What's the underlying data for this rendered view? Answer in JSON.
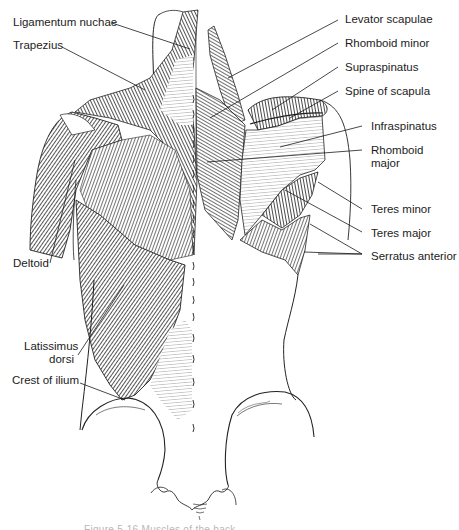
{
  "figure": {
    "labels_left": [
      {
        "id": "ligamentum-nuchae",
        "text": "Ligamentum nuchae"
      },
      {
        "id": "trapezius",
        "text": "Trapezius"
      },
      {
        "id": "deltoid",
        "text": "Deltoid"
      },
      {
        "id": "latissimus-dorsi-1",
        "text": "Latissimus"
      },
      {
        "id": "latissimus-dorsi-2",
        "text": "dorsi"
      },
      {
        "id": "crest-of-ilium",
        "text": "Crest of ilium"
      }
    ],
    "labels_right": [
      {
        "id": "levator-scapulae",
        "text": "Levator scapulae"
      },
      {
        "id": "rhomboid-minor",
        "text": "Rhomboid minor"
      },
      {
        "id": "supraspinatus",
        "text": "Supraspinatus"
      },
      {
        "id": "spine-of-scapula",
        "text": "Spine of scapula"
      },
      {
        "id": "infraspinatus",
        "text": "Infraspinatus"
      },
      {
        "id": "rhomboid-major-1",
        "text": "Rhomboid"
      },
      {
        "id": "rhomboid-major-2",
        "text": "major"
      },
      {
        "id": "teres-minor",
        "text": "Teres minor"
      },
      {
        "id": "teres-major",
        "text": "Teres major"
      },
      {
        "id": "serratus-anterior",
        "text": "Serratus anterior"
      }
    ],
    "caption": "Figure 5-16 Muscles of the back"
  },
  "colors": {
    "ink": "#1c1c1c",
    "muscle_dark": "#3a3a3a",
    "muscle_mid": "#6e6e6e",
    "muscle_light": "#a8a8a8",
    "caption": "#b8b8b8"
  }
}
